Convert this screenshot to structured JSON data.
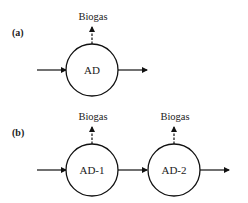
{
  "diagram": {
    "panels": [
      {
        "label": "(a)",
        "nodes": [
          {
            "label": "AD",
            "output": "Biogas"
          }
        ]
      },
      {
        "label": "(b)",
        "nodes": [
          {
            "label": "AD-1",
            "output": "Biogas"
          },
          {
            "label": "AD-2",
            "output": "Biogas"
          }
        ]
      }
    ],
    "colors": {
      "stroke": "#111111",
      "background": "#ffffff"
    }
  }
}
